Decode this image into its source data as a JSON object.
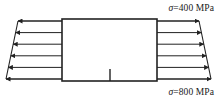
{
  "figure": {
    "stroke_color": "#222222",
    "fill_color": "#ffffff",
    "background_color": "#ffffff",
    "labels": {
      "top_right": "σ=400 MPa",
      "bottom_right": "σ=800 MPa",
      "top_sigma_symbol": "σ",
      "top_value": "400",
      "top_unit": "MPa",
      "bottom_sigma_symbol": "σ",
      "bottom_value": "800",
      "bottom_unit": "MPa"
    },
    "element": {
      "shape": "rectangle",
      "x": 62,
      "y": 19,
      "width": 95,
      "height": 62,
      "crack_mark": {
        "present": true,
        "position": "bottom-center",
        "length": 12
      }
    },
    "left_distribution": {
      "direction": "left",
      "description": "Horizontal arrows pointing left (away from element), lengths decreasing downward, tails on a slanted boundary line",
      "arrow_count": 6,
      "arrow_lengths": [
        44,
        40,
        36,
        32,
        28,
        24
      ],
      "boundary": "slanted-trapezoid-edge"
    },
    "right_distribution": {
      "direction": "right",
      "description": "Horizontal arrows pointing right (away from element), lengths increasing downward, heads on a slanted boundary line",
      "arrow_count": 6,
      "arrow_lengths": [
        24,
        28,
        32,
        36,
        40,
        44
      ],
      "boundary": "slanted-trapezoid-edge"
    }
  }
}
